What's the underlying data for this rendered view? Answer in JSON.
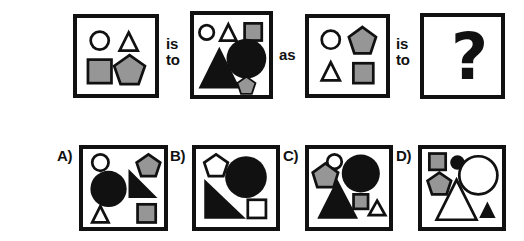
{
  "puzzle": {
    "type": "visual-analogy-matrix",
    "connectors": [
      {
        "id": "conn-1",
        "lines": [
          "is",
          "to"
        ]
      },
      {
        "id": "conn-2",
        "lines": [
          "as"
        ]
      },
      {
        "id": "conn-3",
        "lines": [
          "is",
          "to"
        ]
      }
    ],
    "unknown_glyph": "?",
    "colors": {
      "outline": "#111111",
      "gray_fill": "#969696",
      "black_fill": "#111111",
      "white_fill": "#ffffff",
      "background": "#ffffff"
    },
    "prompt_panels": [
      {
        "id": "panel-1",
        "position": "top-1",
        "x": 73,
        "y": 14,
        "w": 86,
        "h": 84,
        "shapes": [
          {
            "name": "circle-outline-small",
            "type": "circle",
            "fill": "white",
            "cx": 25,
            "cy": 25,
            "r": 10
          },
          {
            "name": "triangle-outline-small",
            "type": "triangle",
            "fill": "white",
            "cx": 57,
            "cy": 26,
            "w": 20,
            "h": 20
          },
          {
            "name": "square-gray-medium",
            "type": "square",
            "fill": "gray",
            "cx": 25,
            "cy": 59,
            "w": 26,
            "h": 26
          },
          {
            "name": "pentagon-gray-medium",
            "type": "pentagon",
            "fill": "gray",
            "cx": 58,
            "cy": 58,
            "r": 17
          }
        ]
      },
      {
        "id": "panel-2",
        "position": "top-2",
        "x": 190,
        "y": 11,
        "w": 83,
        "h": 88,
        "shapes": [
          {
            "name": "circle-outline-small",
            "type": "circle",
            "fill": "white",
            "cx": 14,
            "cy": 19,
            "r": 8
          },
          {
            "name": "triangle-outline-small",
            "type": "triangle",
            "fill": "white",
            "cx": 38,
            "cy": 19,
            "w": 19,
            "h": 18
          },
          {
            "name": "square-gray-small",
            "type": "square",
            "fill": "gray",
            "cx": 65,
            "cy": 18,
            "w": 19,
            "h": 19
          },
          {
            "name": "triangle-black-large",
            "type": "triangle",
            "fill": "black",
            "cx": 28,
            "cy": 58,
            "w": 46,
            "h": 46
          },
          {
            "name": "circle-black-large",
            "type": "circle",
            "fill": "black",
            "cx": 58,
            "cy": 48,
            "r": 22
          },
          {
            "name": "pentagon-gray-small",
            "type": "pentagon",
            "fill": "gray",
            "cx": 58,
            "cy": 78,
            "r": 10
          }
        ]
      },
      {
        "id": "panel-3",
        "position": "top-3",
        "x": 305,
        "y": 14,
        "w": 85,
        "h": 84,
        "shapes": [
          {
            "name": "circle-outline-small",
            "type": "circle",
            "fill": "white",
            "cx": 24,
            "cy": 24,
            "r": 10
          },
          {
            "name": "pentagon-gray-medium",
            "type": "pentagon",
            "fill": "gray",
            "cx": 59,
            "cy": 24,
            "r": 15
          },
          {
            "name": "triangle-outline-small",
            "type": "triangle",
            "fill": "white",
            "cx": 24,
            "cy": 59,
            "w": 20,
            "h": 20
          },
          {
            "name": "square-gray-medium",
            "type": "square",
            "fill": "gray",
            "cx": 60,
            "cy": 61,
            "w": 22,
            "h": 22
          }
        ]
      },
      {
        "id": "panel-4",
        "position": "top-4-answer",
        "x": 420,
        "y": 13,
        "w": 85,
        "h": 86,
        "shapes": []
      }
    ],
    "options": [
      {
        "id": "option-a",
        "label": "A)",
        "label_x": 57,
        "label_y": 147,
        "x": 79,
        "y": 145,
        "w": 89,
        "h": 86,
        "shapes": [
          {
            "name": "circle-outline-small",
            "type": "circle",
            "fill": "white",
            "cx": 19,
            "cy": 15,
            "r": 9
          },
          {
            "name": "pentagon-gray-small",
            "type": "pentagon",
            "fill": "gray",
            "cx": 72,
            "cy": 17,
            "r": 12
          },
          {
            "name": "circle-black-large",
            "type": "circle",
            "fill": "black",
            "cx": 28,
            "cy": 44,
            "r": 20
          },
          {
            "name": "right-triangle-black",
            "type": "right-triangle",
            "fill": "black",
            "x": 50,
            "y": 22,
            "w": 32,
            "h": 32,
            "orient": "down-right"
          },
          {
            "name": "triangle-outline-small",
            "type": "triangle",
            "fill": "white",
            "cx": 19,
            "cy": 72,
            "w": 19,
            "h": 18
          },
          {
            "name": "square-gray-small",
            "type": "square",
            "fill": "gray",
            "cx": 70,
            "cy": 71,
            "w": 20,
            "h": 20
          }
        ]
      },
      {
        "id": "option-b",
        "label": "B)",
        "label_x": 170,
        "label_y": 147,
        "x": 192,
        "y": 145,
        "w": 88,
        "h": 86,
        "shapes": [
          {
            "name": "pentagon-outline-small",
            "type": "pentagon",
            "fill": "white",
            "cx": 22,
            "cy": 17,
            "r": 12
          },
          {
            "name": "circle-black-large",
            "type": "circle",
            "fill": "black",
            "cx": 55,
            "cy": 31,
            "r": 23
          },
          {
            "name": "right-triangle-black",
            "type": "right-triangle",
            "fill": "black",
            "x": 9,
            "y": 33,
            "w": 46,
            "h": 44,
            "orient": "down-right"
          },
          {
            "name": "square-outline-small",
            "type": "square",
            "fill": "white",
            "cx": 67,
            "cy": 66,
            "w": 20,
            "h": 20
          }
        ]
      },
      {
        "id": "option-c",
        "label": "C)",
        "label_x": 283,
        "label_y": 147,
        "x": 305,
        "y": 145,
        "w": 88,
        "h": 86,
        "shapes": [
          {
            "name": "circle-outline-small",
            "type": "circle",
            "fill": "white",
            "cx": 28,
            "cy": 14,
            "r": 8
          },
          {
            "name": "pentagon-gray-medium",
            "type": "pentagon",
            "fill": "gray",
            "cx": 18,
            "cy": 29,
            "r": 14
          },
          {
            "name": "circle-black-large",
            "type": "circle",
            "fill": "black",
            "cx": 57,
            "cy": 27,
            "r": 21
          },
          {
            "name": "triangle-black-large",
            "type": "triangle",
            "fill": "black",
            "cx": 31,
            "cy": 55,
            "w": 45,
            "h": 44
          },
          {
            "name": "square-gray-small",
            "type": "square",
            "fill": "gray",
            "cx": 57,
            "cy": 58,
            "w": 16,
            "h": 16
          },
          {
            "name": "triangle-outline-small",
            "type": "triangle",
            "fill": "white",
            "cx": 75,
            "cy": 65,
            "w": 17,
            "h": 16
          }
        ]
      },
      {
        "id": "option-d",
        "label": "D)",
        "label_x": 396,
        "label_y": 147,
        "x": 418,
        "y": 145,
        "w": 88,
        "h": 86,
        "shapes": [
          {
            "name": "square-gray-small",
            "type": "square",
            "fill": "gray",
            "cx": 17,
            "cy": 14,
            "w": 18,
            "h": 18
          },
          {
            "name": "circle-black-small",
            "type": "circle",
            "fill": "black",
            "cx": 39,
            "cy": 15,
            "r": 8
          },
          {
            "name": "circle-outline-large",
            "type": "circle",
            "fill": "white",
            "cx": 62,
            "cy": 29,
            "r": 21
          },
          {
            "name": "pentagon-gray-medium",
            "type": "pentagon",
            "fill": "gray",
            "cx": 19,
            "cy": 38,
            "r": 13
          },
          {
            "name": "triangle-outline-large",
            "type": "triangle",
            "fill": "white",
            "cx": 38,
            "cy": 56,
            "w": 44,
            "h": 44
          },
          {
            "name": "triangle-black-small",
            "type": "triangle",
            "fill": "black",
            "cx": 72,
            "cy": 67,
            "w": 19,
            "h": 18
          }
        ]
      }
    ]
  }
}
